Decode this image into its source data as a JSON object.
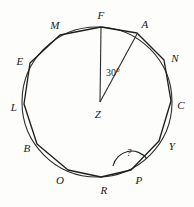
{
  "figure": {
    "background_color": "#fdfdfc",
    "ink_color": "#1f1f1f"
  },
  "circle": {
    "center_label": "Z",
    "center_x": 97,
    "center_y": 102,
    "radius": 75,
    "stroke_color": "#262626",
    "stroke_width": 1.1
  },
  "polygon": {
    "sides": 12,
    "stroke_color": "#1f1f1f",
    "stroke_width": 1.3,
    "vertices": [
      {
        "label": "F",
        "x": 101,
        "y": 27,
        "label_x": 101,
        "label_y": 15
      },
      {
        "label": "A",
        "x": 137,
        "y": 33,
        "label_x": 145,
        "label_y": 24
      },
      {
        "label": "N",
        "x": 164,
        "y": 60,
        "label_x": 175,
        "label_y": 58
      },
      {
        "label": "C",
        "x": 171,
        "y": 101,
        "label_x": 181,
        "label_y": 105
      },
      {
        "label": "Y",
        "x": 159,
        "y": 141,
        "label_x": 172,
        "label_y": 146
      },
      {
        "label": "P",
        "x": 131,
        "y": 170,
        "label_x": 139,
        "label_y": 180
      },
      {
        "label": "R",
        "x": 101,
        "y": 177,
        "label_x": 104,
        "label_y": 190
      },
      {
        "label": "O",
        "x": 68,
        "y": 170,
        "label_x": 60,
        "label_y": 180
      },
      {
        "label": "B",
        "x": 37,
        "y": 144,
        "label_x": 27,
        "label_y": 148
      },
      {
        "label": "L",
        "x": 24,
        "y": 104,
        "label_x": 14,
        "label_y": 107
      },
      {
        "label": "E",
        "x": 30,
        "y": 63,
        "label_x": 20,
        "label_y": 61
      },
      {
        "label": "M",
        "x": 60,
        "y": 35,
        "label_x": 55,
        "label_y": 25
      }
    ]
  },
  "center_point": {
    "label": "Z",
    "x": 97,
    "y": 102,
    "label_x": 98,
    "label_y": 114
  },
  "radii": [
    {
      "name": "radius-z-f",
      "from": "Z",
      "to": "F",
      "x1": 100,
      "y1": 102,
      "x2": 101,
      "y2": 28
    },
    {
      "name": "radius-z-a",
      "from": "Z",
      "to": "A",
      "x1": 100,
      "y1": 102,
      "x2": 137,
      "y2": 34
    }
  ],
  "angles": [
    {
      "name": "central-angle-fza",
      "vertex": "Z",
      "rays": [
        "F",
        "A"
      ],
      "value": "30°",
      "label_x": 113,
      "label_y": 73
    },
    {
      "name": "interior-angle-p",
      "vertex": "P",
      "rays": [
        "O",
        "Y"
      ],
      "value": "?",
      "label_x": 129,
      "label_y": 153,
      "arc_stroke": "#1f1f1f"
    }
  ]
}
